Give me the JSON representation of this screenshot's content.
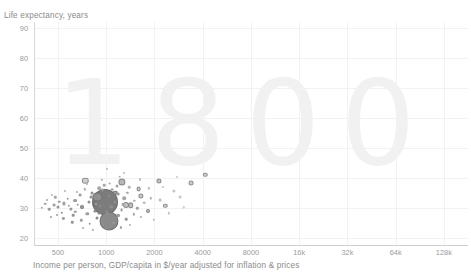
{
  "chart_data": {
    "type": "scatter",
    "title": "",
    "watermark": "1800",
    "xlabel": "Income per person, GDP/capita in $/year adjusted for inflation & prices",
    "ylabel": "Life expectancy, years",
    "xscale": "log",
    "yscale": "linear",
    "xlim": [
      354,
      181019
    ],
    "ylim": [
      17.5,
      92
    ],
    "grid": true,
    "legend": "none",
    "xticks": [
      {
        "value": 500,
        "label": "500"
      },
      {
        "value": 1000,
        "label": "1000"
      },
      {
        "value": 2000,
        "label": "2000"
      },
      {
        "value": 4000,
        "label": "4000"
      },
      {
        "value": 8000,
        "label": "8000"
      },
      {
        "value": 16000,
        "label": "16k"
      },
      {
        "value": 32000,
        "label": "32k"
      },
      {
        "value": 64000,
        "label": "64k"
      },
      {
        "value": 128000,
        "label": "128k"
      }
    ],
    "yticks": [
      {
        "value": 20,
        "label": "20"
      },
      {
        "value": 30,
        "label": "30"
      },
      {
        "value": 40,
        "label": "40"
      },
      {
        "value": 50,
        "label": "50"
      },
      {
        "value": 60,
        "label": "60"
      },
      {
        "value": 70,
        "label": "70"
      },
      {
        "value": 80,
        "label": "80"
      },
      {
        "value": 90,
        "label": "90"
      }
    ],
    "bubble_encoding": {
      "x": "income per person",
      "y": "life expectancy",
      "size": "population",
      "color": "grayscale"
    },
    "points": [
      {
        "x": 985,
        "y": 32.0,
        "r": 13.0,
        "c": "#7c7c7c"
      },
      {
        "x": 1040,
        "y": 25.4,
        "r": 9.5,
        "c": "#8a8a8a"
      },
      {
        "x": 880,
        "y": 33.5,
        "r": 4.6,
        "c": "#8f8f8f"
      },
      {
        "x": 1255,
        "y": 38.6,
        "r": 3.6,
        "c": "#b8b8b8"
      },
      {
        "x": 740,
        "y": 39.0,
        "r": 3.2,
        "c": "#d0d0d0"
      },
      {
        "x": 1320,
        "y": 31.0,
        "r": 3.0,
        "c": "#c2c2c2"
      },
      {
        "x": 1420,
        "y": 30.7,
        "r": 2.8,
        "c": "#bfbfbf"
      },
      {
        "x": 1640,
        "y": 33.8,
        "r": 2.6,
        "c": "#cacaca"
      },
      {
        "x": 1590,
        "y": 36.2,
        "r": 2.4,
        "c": "#c8c8c8"
      },
      {
        "x": 2120,
        "y": 38.8,
        "r": 2.6,
        "c": "#c6c6c6"
      },
      {
        "x": 3400,
        "y": 38.3,
        "r": 2.4,
        "c": "#cdcdcd"
      },
      {
        "x": 4150,
        "y": 41.0,
        "r": 2.2,
        "c": "#d2d2d2"
      },
      {
        "x": 2340,
        "y": 30.6,
        "r": 2.2,
        "c": "#cfcfcf"
      },
      {
        "x": 1830,
        "y": 28.8,
        "r": 2.0,
        "c": "#bdbdbd"
      },
      {
        "x": 1140,
        "y": 35.0,
        "r": 2.2,
        "c": "#9d9d9d"
      },
      {
        "x": 860,
        "y": 31.1,
        "r": 2.4,
        "c": "#969696"
      },
      {
        "x": 705,
        "y": 30.2,
        "r": 2.0,
        "c": "#a2a2a2"
      },
      {
        "x": 640,
        "y": 32.3,
        "r": 1.9,
        "c": "#9b9b9b"
      },
      {
        "x": 905,
        "y": 36.4,
        "r": 1.8,
        "c": "#a8a8a8"
      },
      {
        "x": 1180,
        "y": 27.3,
        "r": 1.9,
        "c": "#999999"
      },
      {
        "x": 1295,
        "y": 33.2,
        "r": 1.8,
        "c": "#a5a5a5"
      },
      {
        "x": 1075,
        "y": 30.3,
        "r": 1.7,
        "c": "#8e8e8e"
      },
      {
        "x": 760,
        "y": 27.9,
        "r": 1.7,
        "c": "#a0a0a0"
      },
      {
        "x": 600,
        "y": 29.6,
        "r": 1.6,
        "c": "#949494"
      },
      {
        "x": 545,
        "y": 31.4,
        "r": 1.6,
        "c": "#9f9f9f"
      },
      {
        "x": 500,
        "y": 30.1,
        "r": 1.5,
        "c": "#989898"
      },
      {
        "x": 470,
        "y": 30.9,
        "r": 1.4,
        "c": "#a3a3a3"
      },
      {
        "x": 440,
        "y": 29.4,
        "r": 1.3,
        "c": "#9c9c9c"
      },
      {
        "x": 415,
        "y": 31.3,
        "r": 1.3,
        "c": "#a6a6a6"
      },
      {
        "x": 395,
        "y": 30.0,
        "r": 1.2,
        "c": "#a9a9a9"
      },
      {
        "x": 820,
        "y": 34.8,
        "r": 1.5,
        "c": "#909090"
      },
      {
        "x": 950,
        "y": 35.9,
        "r": 1.4,
        "c": "#979797"
      },
      {
        "x": 1010,
        "y": 28.5,
        "r": 1.6,
        "c": "#8d8d8d"
      },
      {
        "x": 1160,
        "y": 37.1,
        "r": 1.5,
        "c": "#a4a4a4"
      },
      {
        "x": 1245,
        "y": 29.2,
        "r": 1.4,
        "c": "#9a9a9a"
      },
      {
        "x": 690,
        "y": 34.2,
        "r": 1.4,
        "c": "#a1a1a1"
      },
      {
        "x": 620,
        "y": 27.4,
        "r": 1.3,
        "c": "#959595"
      },
      {
        "x": 575,
        "y": 33.0,
        "r": 1.3,
        "c": "#9e9e9e"
      },
      {
        "x": 530,
        "y": 28.2,
        "r": 1.2,
        "c": "#929292"
      },
      {
        "x": 480,
        "y": 33.4,
        "r": 1.2,
        "c": "#a7a7a7"
      },
      {
        "x": 450,
        "y": 27.0,
        "r": 1.1,
        "c": "#9b9b9b"
      },
      {
        "x": 880,
        "y": 26.6,
        "r": 1.5,
        "c": "#8b8b8b"
      },
      {
        "x": 960,
        "y": 24.3,
        "r": 1.4,
        "c": "#919191"
      },
      {
        "x": 1110,
        "y": 25.0,
        "r": 1.3,
        "c": "#9d9d9d"
      },
      {
        "x": 790,
        "y": 24.6,
        "r": 1.3,
        "c": "#999999"
      },
      {
        "x": 700,
        "y": 25.8,
        "r": 1.2,
        "c": "#a2a2a2"
      },
      {
        "x": 615,
        "y": 25.1,
        "r": 1.2,
        "c": "#969696"
      },
      {
        "x": 540,
        "y": 26.4,
        "r": 1.1,
        "c": "#a0a0a0"
      },
      {
        "x": 1330,
        "y": 26.2,
        "r": 1.3,
        "c": "#949494"
      },
      {
        "x": 1480,
        "y": 27.8,
        "r": 1.2,
        "c": "#a5a5a5"
      },
      {
        "x": 1560,
        "y": 29.8,
        "r": 1.2,
        "c": "#9f9f9f"
      },
      {
        "x": 1720,
        "y": 31.6,
        "r": 1.3,
        "c": "#b0b0b0"
      },
      {
        "x": 1900,
        "y": 33.1,
        "r": 1.2,
        "c": "#b5b5b5"
      },
      {
        "x": 1640,
        "y": 26.9,
        "r": 1.1,
        "c": "#a8a8a8"
      },
      {
        "x": 1050,
        "y": 38.0,
        "r": 1.4,
        "c": "#aaaaaa"
      },
      {
        "x": 1215,
        "y": 40.3,
        "r": 1.3,
        "c": "#b2b2b2"
      },
      {
        "x": 935,
        "y": 39.2,
        "r": 1.2,
        "c": "#a6a6a6"
      },
      {
        "x": 1390,
        "y": 36.8,
        "r": 1.3,
        "c": "#b4b4b4"
      },
      {
        "x": 1010,
        "y": 42.8,
        "r": 1.0,
        "c": "#b6b6b6"
      },
      {
        "x": 845,
        "y": 29.0,
        "r": 1.6,
        "c": "#8c8c8c"
      },
      {
        "x": 775,
        "y": 31.8,
        "r": 1.5,
        "c": "#939393"
      },
      {
        "x": 915,
        "y": 30.6,
        "r": 1.5,
        "c": "#8a8a8a"
      },
      {
        "x": 665,
        "y": 31.0,
        "r": 1.3,
        "c": "#9a9a9a"
      },
      {
        "x": 585,
        "y": 30.5,
        "r": 1.2,
        "c": "#a1a1a1"
      },
      {
        "x": 510,
        "y": 32.0,
        "r": 1.2,
        "c": "#9d9d9d"
      },
      {
        "x": 1140,
        "y": 31.9,
        "r": 1.5,
        "c": "#8f8f8f"
      },
      {
        "x": 1270,
        "y": 31.2,
        "r": 1.3,
        "c": "#a3a3a3"
      },
      {
        "x": 735,
        "y": 36.1,
        "r": 1.2,
        "c": "#aeaeae"
      },
      {
        "x": 655,
        "y": 35.3,
        "r": 1.1,
        "c": "#ababab"
      },
      {
        "x": 460,
        "y": 34.1,
        "r": 1.1,
        "c": "#b1b1b1"
      },
      {
        "x": 425,
        "y": 32.6,
        "r": 1.0,
        "c": "#a4a4a4"
      },
      {
        "x": 1035,
        "y": 34.0,
        "r": 1.7,
        "c": "#878787"
      },
      {
        "x": 1190,
        "y": 34.6,
        "r": 1.4,
        "c": "#9c9c9c"
      },
      {
        "x": 2650,
        "y": 35.5,
        "r": 1.6,
        "c": "#c4c4c4"
      },
      {
        "x": 2900,
        "y": 33.4,
        "r": 1.4,
        "c": "#cacaca"
      },
      {
        "x": 2180,
        "y": 32.4,
        "r": 1.4,
        "c": "#c0c0c0"
      },
      {
        "x": 2450,
        "y": 28.1,
        "r": 1.2,
        "c": "#c6c6c6"
      },
      {
        "x": 1980,
        "y": 26.0,
        "r": 1.2,
        "c": "#bababa"
      },
      {
        "x": 3050,
        "y": 30.1,
        "r": 1.2,
        "c": "#cecece"
      },
      {
        "x": 990,
        "y": 22.9,
        "r": 1.2,
        "c": "#9b9b9b"
      },
      {
        "x": 830,
        "y": 22.6,
        "r": 1.1,
        "c": "#a5a5a5"
      },
      {
        "x": 1230,
        "y": 23.4,
        "r": 1.1,
        "c": "#a0a0a0"
      },
      {
        "x": 720,
        "y": 23.2,
        "r": 1.0,
        "c": "#aaaaaa"
      },
      {
        "x": 1410,
        "y": 24.2,
        "r": 1.1,
        "c": "#aeaeae"
      },
      {
        "x": 555,
        "y": 35.6,
        "r": 1.1,
        "c": "#b3b3b3"
      },
      {
        "x": 495,
        "y": 27.6,
        "r": 1.0,
        "c": "#9e9e9e"
      },
      {
        "x": 905,
        "y": 28.0,
        "r": 1.4,
        "c": "#8e8e8e"
      },
      {
        "x": 1090,
        "y": 36.0,
        "r": 1.4,
        "c": "#959595"
      },
      {
        "x": 1350,
        "y": 35.0,
        "r": 1.2,
        "c": "#a9a9a9"
      },
      {
        "x": 800,
        "y": 33.6,
        "r": 1.4,
        "c": "#929292"
      },
      {
        "x": 640,
        "y": 28.6,
        "r": 1.2,
        "c": "#979797"
      },
      {
        "x": 1500,
        "y": 32.2,
        "r": 1.2,
        "c": "#b7b7b7"
      },
      {
        "x": 1850,
        "y": 36.5,
        "r": 1.2,
        "c": "#bcbcbc"
      },
      {
        "x": 2250,
        "y": 36.9,
        "r": 1.1,
        "c": "#c2c2c2"
      },
      {
        "x": 970,
        "y": 37.4,
        "r": 1.3,
        "c": "#a7a7a7"
      },
      {
        "x": 755,
        "y": 37.8,
        "r": 1.1,
        "c": "#b0b0b0"
      },
      {
        "x": 1615,
        "y": 39.4,
        "r": 1.1,
        "c": "#bebebe"
      },
      {
        "x": 1290,
        "y": 41.4,
        "r": 1.0,
        "c": "#bababa"
      },
      {
        "x": 2750,
        "y": 40.2,
        "r": 1.1,
        "c": "#c9c9c9"
      }
    ]
  }
}
